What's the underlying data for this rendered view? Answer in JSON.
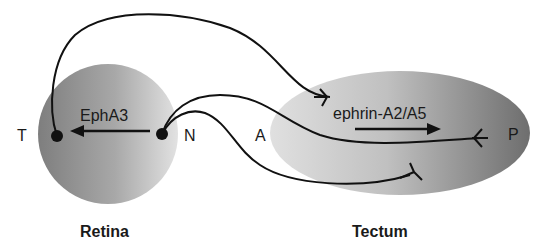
{
  "retina": {
    "title": "Retina",
    "receptor_label": "EphA3",
    "pole_left": "T",
    "pole_right": "N"
  },
  "tectum": {
    "title": "Tectum",
    "ligand_label": "ephrin-A2/A5",
    "pole_left": "A",
    "pole_right": "P"
  },
  "colors": {
    "line": "#111111",
    "shape_light": "#d8d8d8",
    "shape_dark": "#7a7a7a",
    "text": "#1a1a1a"
  }
}
